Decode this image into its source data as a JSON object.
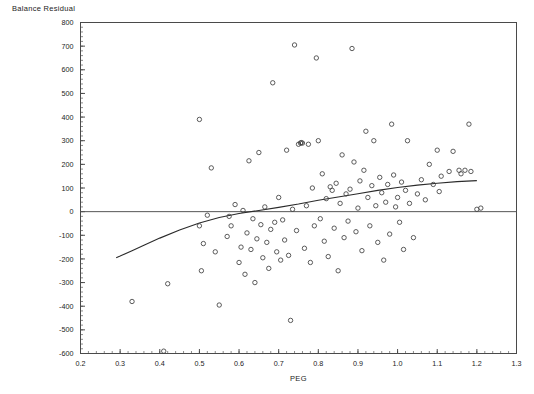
{
  "chart_data": {
    "type": "scatter",
    "title": "Balance Residual",
    "xlabel": "PEG",
    "ylabel": "",
    "xlim": [
      0.2,
      1.3
    ],
    "ylim": [
      -600,
      800
    ],
    "xticks": [
      0.2,
      0.3,
      0.4,
      0.5,
      0.6,
      0.7,
      0.8,
      0.9,
      1.0,
      1.1,
      1.2,
      1.3
    ],
    "xtick_labels": [
      "0.2",
      "0.3",
      "0.4",
      "0.5",
      "0.6",
      "0.7",
      "0.8",
      "0.9",
      "1.0",
      "1.1",
      "1.2",
      "1.3"
    ],
    "yticks": [
      -600,
      -500,
      -400,
      -300,
      -200,
      -100,
      0,
      100,
      200,
      300,
      400,
      500,
      600,
      700,
      800
    ],
    "ytick_labels": [
      "-600",
      "-500",
      "-400",
      "-300",
      "-200",
      "-100",
      "0",
      "100",
      "200",
      "300",
      "400",
      "500",
      "600",
      "700",
      "800"
    ],
    "grid": false,
    "legend": false,
    "minor_ticks": true,
    "x_minor_interval": 0.02,
    "y_minor_interval": 20,
    "reference_line": {
      "orientation": "horizontal",
      "y": 0
    },
    "series": [
      {
        "name": "Balance Residual vs PEG",
        "marker": "open-circle",
        "points": [
          [
            0.33,
            -380
          ],
          [
            0.41,
            -590
          ],
          [
            0.42,
            -305
          ],
          [
            0.5,
            -60
          ],
          [
            0.5,
            390
          ],
          [
            0.51,
            -135
          ],
          [
            0.505,
            -250
          ],
          [
            0.52,
            -15
          ],
          [
            0.53,
            185
          ],
          [
            0.54,
            -170
          ],
          [
            0.55,
            -395
          ],
          [
            0.57,
            -105
          ],
          [
            0.575,
            -20
          ],
          [
            0.58,
            -60
          ],
          [
            0.59,
            30
          ],
          [
            0.6,
            -215
          ],
          [
            0.605,
            -150
          ],
          [
            0.61,
            5
          ],
          [
            0.615,
            -265
          ],
          [
            0.62,
            -90
          ],
          [
            0.625,
            215
          ],
          [
            0.63,
            -160
          ],
          [
            0.635,
            -30
          ],
          [
            0.64,
            -300
          ],
          [
            0.645,
            -115
          ],
          [
            0.65,
            250
          ],
          [
            0.655,
            -55
          ],
          [
            0.66,
            -195
          ],
          [
            0.665,
            20
          ],
          [
            0.67,
            -130
          ],
          [
            0.675,
            -240
          ],
          [
            0.68,
            -75
          ],
          [
            0.685,
            545
          ],
          [
            0.69,
            -45
          ],
          [
            0.695,
            -170
          ],
          [
            0.7,
            60
          ],
          [
            0.705,
            -205
          ],
          [
            0.71,
            -35
          ],
          [
            0.715,
            -120
          ],
          [
            0.72,
            260
          ],
          [
            0.725,
            -185
          ],
          [
            0.73,
            -460
          ],
          [
            0.735,
            10
          ],
          [
            0.74,
            705
          ],
          [
            0.745,
            -80
          ],
          [
            0.75,
            285
          ],
          [
            0.755,
            290
          ],
          [
            0.757,
            292
          ],
          [
            0.76,
            290
          ],
          [
            0.765,
            -155
          ],
          [
            0.77,
            25
          ],
          [
            0.775,
            285
          ],
          [
            0.78,
            -215
          ],
          [
            0.785,
            100
          ],
          [
            0.79,
            -60
          ],
          [
            0.795,
            650
          ],
          [
            0.8,
            300
          ],
          [
            0.805,
            -30
          ],
          [
            0.81,
            160
          ],
          [
            0.815,
            -125
          ],
          [
            0.82,
            55
          ],
          [
            0.825,
            -190
          ],
          [
            0.83,
            105
          ],
          [
            0.835,
            90
          ],
          [
            0.84,
            -70
          ],
          [
            0.845,
            120
          ],
          [
            0.85,
            -250
          ],
          [
            0.855,
            35
          ],
          [
            0.86,
            240
          ],
          [
            0.865,
            -110
          ],
          [
            0.87,
            75
          ],
          [
            0.875,
            -40
          ],
          [
            0.88,
            95
          ],
          [
            0.885,
            690
          ],
          [
            0.89,
            210
          ],
          [
            0.895,
            -85
          ],
          [
            0.9,
            15
          ],
          [
            0.905,
            130
          ],
          [
            0.91,
            -165
          ],
          [
            0.915,
            175
          ],
          [
            0.92,
            340
          ],
          [
            0.925,
            60
          ],
          [
            0.93,
            -60
          ],
          [
            0.935,
            110
          ],
          [
            0.94,
            300
          ],
          [
            0.945,
            25
          ],
          [
            0.95,
            -130
          ],
          [
            0.955,
            145
          ],
          [
            0.96,
            80
          ],
          [
            0.965,
            -205
          ],
          [
            0.97,
            40
          ],
          [
            0.975,
            115
          ],
          [
            0.98,
            -95
          ],
          [
            0.985,
            370
          ],
          [
            0.99,
            155
          ],
          [
            0.995,
            20
          ],
          [
            1.0,
            60
          ],
          [
            1.005,
            -45
          ],
          [
            1.01,
            125
          ],
          [
            1.015,
            -160
          ],
          [
            1.02,
            90
          ],
          [
            1.025,
            300
          ],
          [
            1.03,
            35
          ],
          [
            1.04,
            -110
          ],
          [
            1.05,
            75
          ],
          [
            1.06,
            135
          ],
          [
            1.07,
            50
          ],
          [
            1.08,
            200
          ],
          [
            1.09,
            115
          ],
          [
            1.1,
            260
          ],
          [
            1.105,
            85
          ],
          [
            1.11,
            150
          ],
          [
            1.13,
            170
          ],
          [
            1.14,
            255
          ],
          [
            1.155,
            175
          ],
          [
            1.16,
            160
          ],
          [
            1.17,
            175
          ],
          [
            1.18,
            370
          ],
          [
            1.185,
            170
          ],
          [
            1.2,
            10
          ],
          [
            1.21,
            15
          ]
        ]
      }
    ],
    "fit_curve": {
      "name": "smoothed-fit",
      "points": [
        [
          0.29,
          -195
        ],
        [
          0.3,
          -188
        ],
        [
          0.33,
          -165
        ],
        [
          0.36,
          -142
        ],
        [
          0.4,
          -112
        ],
        [
          0.45,
          -78
        ],
        [
          0.5,
          -48
        ],
        [
          0.55,
          -25
        ],
        [
          0.6,
          -8
        ],
        [
          0.65,
          5
        ],
        [
          0.7,
          18
        ],
        [
          0.75,
          32
        ],
        [
          0.8,
          48
        ],
        [
          0.85,
          62
        ],
        [
          0.9,
          76
        ],
        [
          0.95,
          90
        ],
        [
          1.0,
          102
        ],
        [
          1.05,
          112
        ],
        [
          1.1,
          120
        ],
        [
          1.15,
          127
        ],
        [
          1.2,
          131
        ]
      ]
    }
  }
}
